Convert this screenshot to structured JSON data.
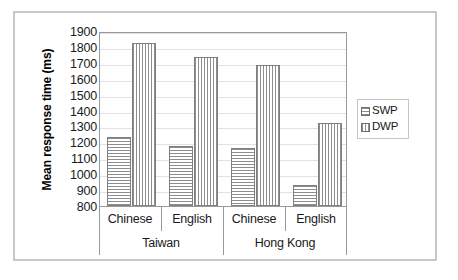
{
  "chart_data": {
    "type": "bar",
    "title": "",
    "xlabel": "",
    "ylabel": "Mean response time (ms)",
    "ylim": [
      800,
      1900
    ],
    "ytick_step": 100,
    "yticks": [
      1900,
      1800,
      1700,
      1600,
      1500,
      1400,
      1300,
      1200,
      1100,
      1000,
      900,
      800
    ],
    "grid": true,
    "legend_position": "right",
    "categories": [
      "Chinese",
      "English",
      "Chinese",
      "English"
    ],
    "group_labels": [
      "Taiwan",
      "Hong Kong"
    ],
    "series": [
      {
        "name": "SWP",
        "pattern": "horizontal-hatch",
        "values": [
          1235,
          1180,
          1165,
          935
        ]
      },
      {
        "name": "DWP",
        "pattern": "vertical-hatch",
        "values": [
          1825,
          1735,
          1685,
          1320
        ]
      }
    ],
    "groups": [
      {
        "region": "Taiwan",
        "bars": [
          {
            "category": "Chinese",
            "series": "SWP",
            "value": 1235
          },
          {
            "category": "Chinese",
            "series": "DWP",
            "value": 1825
          },
          {
            "category": "English",
            "series": "SWP",
            "value": 1180
          },
          {
            "category": "English",
            "series": "DWP",
            "value": 1735
          }
        ]
      },
      {
        "region": "Hong Kong",
        "bars": [
          {
            "category": "Chinese",
            "series": "SWP",
            "value": 1165
          },
          {
            "category": "Chinese",
            "series": "DWP",
            "value": 1685
          },
          {
            "category": "English",
            "series": "SWP",
            "value": 935
          },
          {
            "category": "English",
            "series": "DWP",
            "value": 1320
          }
        ]
      }
    ]
  },
  "legend": {
    "items": [
      {
        "label": "SWP",
        "pattern": "horizontal-hatch"
      },
      {
        "label": "DWP",
        "pattern": "vertical-hatch"
      }
    ]
  },
  "colors": {
    "frame": "#c8c8c8",
    "plot_border": "#9a9a9a",
    "gridline": "#e2e2e2",
    "bar_outline": "#808080",
    "hatch": "#8d8d8d",
    "text": "#1a1a1a",
    "background": "#ffffff"
  }
}
